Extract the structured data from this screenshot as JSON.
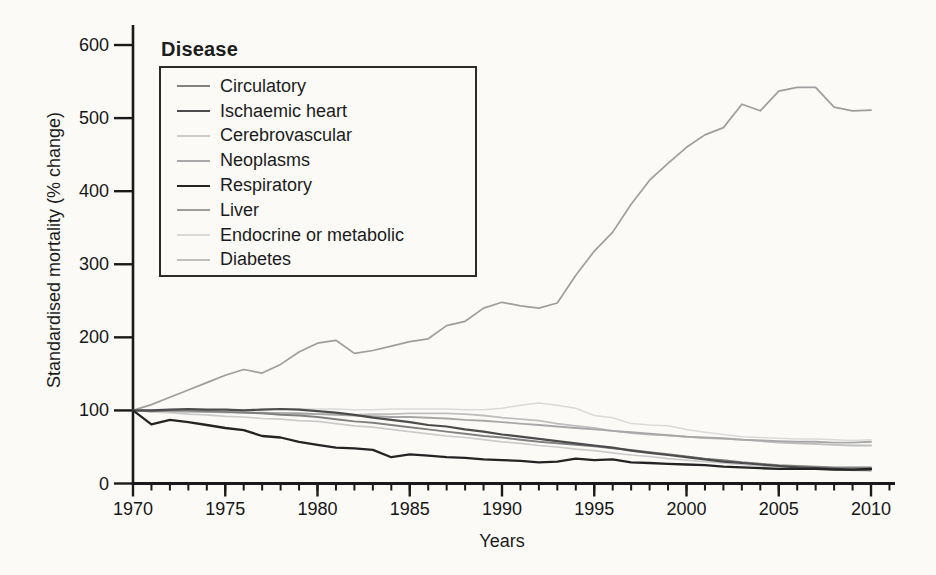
{
  "figure": {
    "background_color": "#fbfaf7",
    "axis_color": "#1a1a1a"
  },
  "chart_data": {
    "type": "line",
    "legend_title": "Disease",
    "xlabel": "Years",
    "ylabel": "Standardised mortality (% change)",
    "ylim": [
      0,
      600
    ],
    "y_ticks": [
      0,
      100,
      200,
      300,
      400,
      500,
      600
    ],
    "x_ticks": [
      1970,
      1975,
      1980,
      1985,
      1990,
      1995,
      2000,
      2005,
      2010
    ],
    "x_minor_tick_interval": 1,
    "grid": false,
    "legend_position": "top-left",
    "years": [
      1970,
      1971,
      1972,
      1973,
      1974,
      1975,
      1976,
      1977,
      1978,
      1979,
      1980,
      1981,
      1982,
      1983,
      1984,
      1985,
      1986,
      1987,
      1988,
      1989,
      1990,
      1991,
      1992,
      1993,
      1994,
      1995,
      1996,
      1997,
      1998,
      1999,
      2000,
      2001,
      2002,
      2003,
      2004,
      2005,
      2006,
      2007,
      2008,
      2009,
      2010
    ],
    "series": [
      {
        "name": "Circulatory",
        "color": "#818181",
        "width": 1.9,
        "values": [
          100,
          99,
          100,
          100,
          99,
          98,
          97,
          96,
          94,
          93,
          91,
          88,
          85,
          83,
          80,
          77,
          74,
          71,
          68,
          65,
          63,
          60,
          57,
          55,
          53,
          51,
          48,
          46,
          43,
          40,
          37,
          34,
          32,
          29,
          27,
          25,
          24,
          23,
          22,
          22,
          22
        ]
      },
      {
        "name": "Ischaemic heart",
        "color": "#4c4c4c",
        "width": 2.2,
        "values": [
          100,
          100,
          101,
          102,
          101,
          101,
          100,
          101,
          102,
          101,
          99,
          97,
          94,
          90,
          87,
          84,
          80,
          78,
          74,
          71,
          67,
          64,
          61,
          58,
          55,
          52,
          49,
          45,
          42,
          39,
          36,
          33,
          30,
          28,
          26,
          24,
          22,
          21,
          20,
          19,
          19
        ]
      },
      {
        "name": "Cerebrovascular",
        "color": "#cbcbcb",
        "width": 1.7,
        "values": [
          100,
          98,
          97,
          95,
          94,
          92,
          91,
          89,
          88,
          86,
          85,
          82,
          79,
          77,
          74,
          71,
          68,
          65,
          63,
          60,
          57,
          55,
          52,
          50,
          47,
          45,
          42,
          39,
          37,
          34,
          32,
          30,
          28,
          26,
          24,
          23,
          21,
          20,
          19,
          18,
          17
        ]
      },
      {
        "name": "Neoplasms",
        "color": "#a8a8a8",
        "width": 1.9,
        "values": [
          100,
          100,
          99,
          99,
          98,
          98,
          97,
          97,
          96,
          96,
          95,
          94,
          93,
          92,
          91,
          91,
          90,
          89,
          87,
          86,
          84,
          82,
          80,
          78,
          76,
          74,
          72,
          70,
          68,
          66,
          64,
          63,
          62,
          60,
          59,
          58,
          57,
          57,
          56,
          56,
          57
        ]
      },
      {
        "name": "Respiratory",
        "color": "#242424",
        "width": 2.3,
        "values": [
          100,
          81,
          87,
          84,
          80,
          76,
          73,
          65,
          63,
          57,
          53,
          49,
          48,
          46,
          36,
          40,
          38,
          36,
          35,
          33,
          32,
          31,
          29,
          30,
          34,
          32,
          33,
          29,
          28,
          27,
          26,
          25,
          23,
          22,
          21,
          20,
          20,
          20,
          19,
          19,
          20
        ]
      },
      {
        "name": "Liver",
        "color": "#9e9e9e",
        "width": 1.7,
        "values": [
          100,
          108,
          118,
          128,
          138,
          148,
          156,
          151,
          163,
          180,
          192,
          196,
          178,
          182,
          188,
          194,
          198,
          216,
          222,
          240,
          248,
          243,
          240,
          247,
          285,
          318,
          344,
          382,
          415,
          438,
          460,
          477,
          487,
          519,
          510,
          537,
          542,
          542,
          515,
          510,
          511
        ]
      },
      {
        "name": "Endocrine or metabolic",
        "color": "#dadada",
        "width": 1.5,
        "values": [
          100,
          100,
          100,
          101,
          101,
          101,
          101,
          102,
          102,
          102,
          102,
          102,
          101,
          101,
          102,
          102,
          102,
          102,
          101,
          101,
          103,
          107,
          110,
          107,
          103,
          93,
          90,
          82,
          80,
          79,
          74,
          70,
          67,
          64,
          63,
          62,
          61,
          61,
          60,
          59,
          60
        ]
      },
      {
        "name": "Diabetes",
        "color": "#bfbfbf",
        "width": 1.8,
        "values": [
          100,
          99,
          99,
          98,
          98,
          97,
          97,
          96,
          96,
          95,
          95,
          95,
          94,
          95,
          95,
          96,
          96,
          96,
          95,
          93,
          90,
          88,
          86,
          82,
          79,
          76,
          72,
          69,
          67,
          66,
          64,
          62,
          61,
          60,
          58,
          56,
          55,
          54,
          53,
          52,
          52
        ]
      }
    ]
  }
}
